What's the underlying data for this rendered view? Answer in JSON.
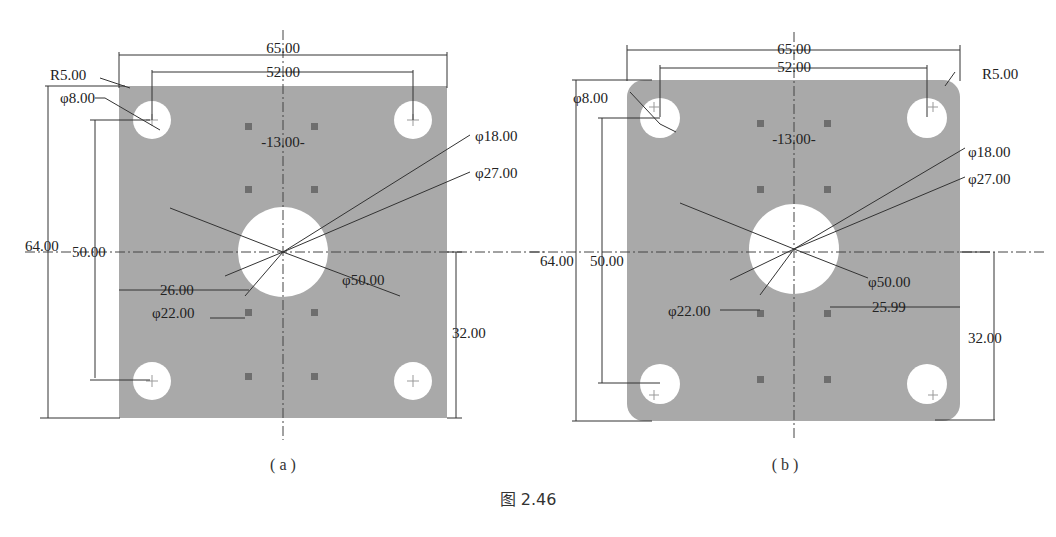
{
  "figure": {
    "caption": "图 2.46",
    "subfigures": [
      {
        "label": "( a )",
        "corner_style": "square",
        "dims": {
          "width_total": "65.00",
          "hole_spacing_x": "52.00",
          "corner_radius": "R5.00",
          "small_hole_dia": "φ8.00",
          "square_spacing": "-13.00-",
          "dia_18": "φ18.00",
          "dia_27": "φ27.00",
          "height_total": "64.00",
          "hole_spacing_y": "50.00",
          "offset_x": "26.00",
          "dia_22": "φ22.00",
          "dia_50": "φ50.00",
          "half_height": "32.00"
        }
      },
      {
        "label": "( b )",
        "corner_style": "rounded",
        "dims": {
          "width_total": "65.00",
          "hole_spacing_x": "52.00",
          "corner_radius": "R5.00",
          "small_hole_dia": "φ8.00",
          "square_spacing": "-13.00-",
          "dia_18": "φ18.00",
          "dia_27": "φ27.00",
          "height_total": "64.00",
          "hole_spacing_y": "50.00",
          "offset_x": "25.99",
          "dia_22": "φ22.00",
          "dia_50": "φ50.00",
          "half_height": "32.00"
        }
      }
    ]
  },
  "colors": {
    "plate": "#a9a9a9",
    "hole": "#ffffff",
    "line": "#333333"
  }
}
